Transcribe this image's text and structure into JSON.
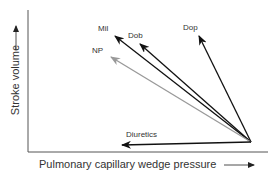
{
  "diagram": {
    "y_axis_label": "Stroke volume",
    "x_axis_label": "Pulmonary capillary wedge pressure",
    "origin": {
      "x": 251,
      "y": 142
    },
    "arrows": [
      {
        "label": "Mil",
        "tip_x": 115,
        "tip_y": 36,
        "label_x": 98,
        "label_y": 31,
        "color": "#111111"
      },
      {
        "label": "Dob",
        "tip_x": 140,
        "tip_y": 44,
        "label_x": 128,
        "label_y": 38,
        "color": "#111111"
      },
      {
        "label": "Dop",
        "tip_x": 199,
        "tip_y": 36,
        "label_x": 183,
        "label_y": 30,
        "color": "#111111"
      },
      {
        "label": "NP",
        "tip_x": 111,
        "tip_y": 57,
        "label_x": 92,
        "label_y": 53,
        "color": "#999999"
      },
      {
        "label": "Diuretics",
        "tip_x": 122,
        "tip_y": 145,
        "label_x": 126,
        "label_y": 137,
        "color": "#111111"
      }
    ]
  }
}
